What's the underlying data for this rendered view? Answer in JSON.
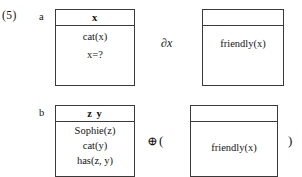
{
  "equation": {
    "number": "(5)"
  },
  "rows": [
    {
      "label": "a",
      "left_box": {
        "header": "x",
        "lines": [
          "cat(x)",
          "x=?"
        ]
      },
      "operator": "∂x",
      "right_box": {
        "header": "",
        "lines": [
          "friendly(x)"
        ]
      },
      "paren_open": "",
      "paren_close": ""
    },
    {
      "label": "b",
      "left_box": {
        "header": "z   y",
        "lines": [
          "Sophie(z)",
          "cat(y)",
          "has(z, y)"
        ]
      },
      "operator": "⊕",
      "right_box": {
        "header": "",
        "lines": [
          "friendly(x)"
        ]
      },
      "paren_open": "(",
      "paren_close": ")"
    }
  ],
  "colors": {
    "border": "#3a3a3a",
    "text": "#141414",
    "background": "#ffffff"
  }
}
